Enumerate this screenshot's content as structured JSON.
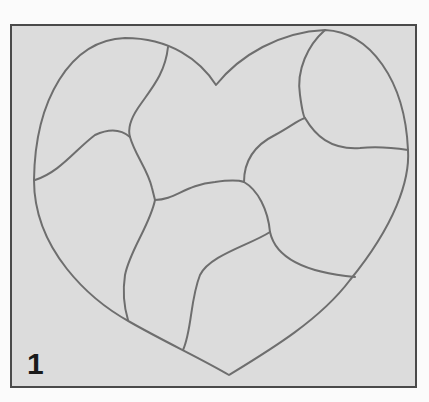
{
  "figure": {
    "step_number": "1",
    "colors": {
      "page_background": "#fbfbfb",
      "panel_background": "#dcdcdc",
      "frame_border": "#4a4a4a",
      "line_color": "#6e6e6e",
      "number_color": "#1a1a1a"
    }
  }
}
